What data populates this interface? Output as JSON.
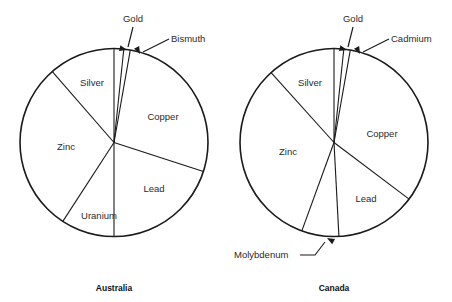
{
  "figure": {
    "width": 452,
    "height": 302,
    "background": "#ffffff",
    "line_color": "#1a1a1a",
    "text_color": "#2a2a2a"
  },
  "chart_data": {
    "type": "pie",
    "title": "",
    "subtitle": "",
    "xlabel": "",
    "ylabel": "",
    "legend_position": "none",
    "grid": false,
    "note": "Two side-by-side pie charts comparing mineral production shares. Slice sizes read off the drawn sector angles, starting at 12 o'clock and proceeding clockwise; values are percentages of each circle.",
    "charts": [
      {
        "title": "Australia",
        "start_angle_deg": 0,
        "direction": "clockwise",
        "center": {
          "x": 114,
          "y": 142.5
        },
        "radius": 94,
        "categories": [
          "Gold",
          "Bismuth",
          "Copper",
          "Lead",
          "Uranium",
          "Zinc",
          "Silver"
        ],
        "values": [
          1.7,
          1.1,
          27.2,
          20.0,
          9.2,
          29.4,
          11.4
        ],
        "angles_deg": [
          6,
          4,
          98,
          72,
          33,
          106,
          41
        ],
        "labels": [
          {
            "name": "Gold",
            "placement": "callout",
            "text_x": 133,
            "text_y": 22,
            "anchor": "middle",
            "leader": [
              [
                133,
                27
              ],
              [
                128,
                47
              ]
            ],
            "arrow_at": [
              127,
              50
            ],
            "arrow_angle_deg": 104
          },
          {
            "name": "Bismuth",
            "placement": "callout",
            "text_x": 171,
            "text_y": 42,
            "anchor": "start",
            "leader": [
              [
                169,
                39
              ],
              [
                143,
                52
              ]
            ],
            "arrow_at": [
              140,
              54
            ],
            "arrow_angle_deg": 153
          },
          {
            "name": "Copper",
            "placement": "inside",
            "text_x": 163,
            "text_y": 120,
            "anchor": "middle"
          },
          {
            "name": "Lead",
            "placement": "inside",
            "text_x": 154,
            "text_y": 192,
            "anchor": "middle"
          },
          {
            "name": "Uranium",
            "placement": "inside",
            "text_x": 99,
            "text_y": 219,
            "anchor": "middle"
          },
          {
            "name": "Zinc",
            "placement": "inside",
            "text_x": 66,
            "text_y": 150,
            "anchor": "middle"
          },
          {
            "name": "Silver",
            "placement": "inside",
            "text_x": 92,
            "text_y": 86,
            "anchor": "middle"
          }
        ]
      },
      {
        "title": "Canada",
        "start_angle_deg": 0,
        "direction": "clockwise",
        "center": {
          "x": 334,
          "y": 142.5
        },
        "radius": 94,
        "categories": [
          "Gold",
          "Cadmium",
          "Copper",
          "Lead",
          "Molybdenum",
          "Zinc",
          "Silver"
        ],
        "values": [
          1.7,
          1.1,
          32.5,
          13.9,
          6.4,
          32.8,
          11.7
        ],
        "angles_deg": [
          6,
          4,
          117,
          50,
          23,
          118,
          42
        ],
        "labels": [
          {
            "name": "Gold",
            "placement": "callout",
            "text_x": 353,
            "text_y": 22,
            "anchor": "middle",
            "leader": [
              [
                353,
                27
              ],
              [
                348,
                47
              ]
            ],
            "arrow_at": [
              347,
              50
            ],
            "arrow_angle_deg": 104
          },
          {
            "name": "Cadmium",
            "placement": "callout",
            "text_x": 391,
            "text_y": 42,
            "anchor": "start",
            "leader": [
              [
                389,
                39
              ],
              [
                363,
                52
              ]
            ],
            "arrow_at": [
              360,
              54
            ],
            "arrow_angle_deg": 153
          },
          {
            "name": "Copper",
            "placement": "inside",
            "text_x": 382,
            "text_y": 137,
            "anchor": "middle"
          },
          {
            "name": "Lead",
            "placement": "inside",
            "text_x": 366,
            "text_y": 202,
            "anchor": "middle"
          },
          {
            "name": "Molybdenum",
            "placement": "callout",
            "text_x": 234,
            "text_y": 258,
            "anchor": "start",
            "leader": [
              [
                300,
                255
              ],
              [
                315,
                255
              ],
              [
                325,
                242
              ]
            ],
            "arrow_at": [
              327,
              238
            ],
            "arrow_angle_deg": 299
          },
          {
            "name": "Zinc",
            "placement": "inside",
            "text_x": 288,
            "text_y": 155,
            "anchor": "middle"
          },
          {
            "name": "Silver",
            "placement": "inside",
            "text_x": 310,
            "text_y": 86,
            "anchor": "middle"
          }
        ]
      }
    ]
  },
  "charts": {
    "australia": {
      "title": "Australia",
      "title_x": 114,
      "title_y": 291,
      "slices": {
        "gold": "Gold",
        "bismuth": "Bismuth",
        "copper": "Copper",
        "lead": "Lead",
        "uranium": "Uranium",
        "zinc": "Zinc",
        "silver": "Silver"
      }
    },
    "canada": {
      "title": "Canada",
      "title_x": 334,
      "title_y": 291,
      "slices": {
        "gold": "Gold",
        "cadmium": "Cadmium",
        "copper": "Copper",
        "lead": "Lead",
        "molybdenum": "Molybdenum",
        "zinc": "Zinc",
        "silver": "Silver"
      }
    }
  }
}
